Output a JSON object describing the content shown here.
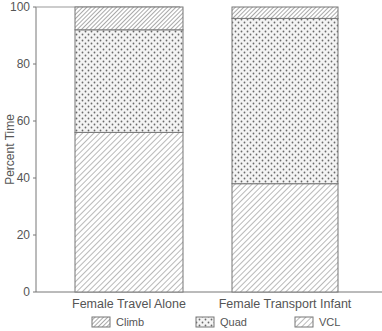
{
  "chart_data": {
    "type": "bar",
    "stacked": true,
    "title": "",
    "xlabel": "",
    "ylabel": "Percent  Time",
    "ylim": [
      0,
      100
    ],
    "yticks": [
      0,
      20,
      40,
      60,
      80,
      100
    ],
    "grid": false,
    "legend_position": "bottom",
    "categories": [
      "Female Travel Alone",
      "Female Transport Infant"
    ],
    "series": [
      {
        "name": "VCL",
        "pattern": "diagonal-hatch-light",
        "values": [
          56,
          38
        ]
      },
      {
        "name": "Quad",
        "pattern": "dots",
        "values": [
          36,
          58
        ]
      },
      {
        "name": "Climb",
        "pattern": "diagonal-hatch-dense",
        "values": [
          8,
          4
        ]
      }
    ],
    "legend": [
      "Climb",
      "Quad",
      "VCL"
    ]
  },
  "axis": {
    "ylabel": "Percent  Time",
    "ticks": [
      "0",
      "20",
      "40",
      "60",
      "80",
      "100"
    ]
  },
  "categories": [
    "Female Travel Alone",
    "Female Transport Infant"
  ],
  "legend": {
    "items": [
      "Climb",
      "Quad",
      "VCL"
    ]
  }
}
